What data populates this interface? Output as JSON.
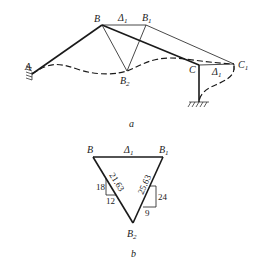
{
  "figure_a": {
    "caption": "a",
    "labels": {
      "A": "A",
      "B": "B",
      "B1": "B",
      "B1_sub": "1",
      "B2": "B",
      "B2_sub": "2",
      "C": "C",
      "C1": "C",
      "C1_sub": "1",
      "delta_top": "Δ",
      "delta_top_sub": "1",
      "delta_right": "Δ",
      "delta_right_sub": "1"
    }
  },
  "figure_b": {
    "caption": "b",
    "labels": {
      "B": "B",
      "B1": "B",
      "B1_sub": "1",
      "B2": "B",
      "B2_sub": "2",
      "delta": "Δ",
      "delta_sub": "1"
    },
    "left_slope": {
      "hypotenuse": "21.63",
      "rise": "18",
      "run": "12"
    },
    "right_slope": {
      "hypotenuse": "25.63",
      "rise": "24",
      "run": "9"
    }
  }
}
